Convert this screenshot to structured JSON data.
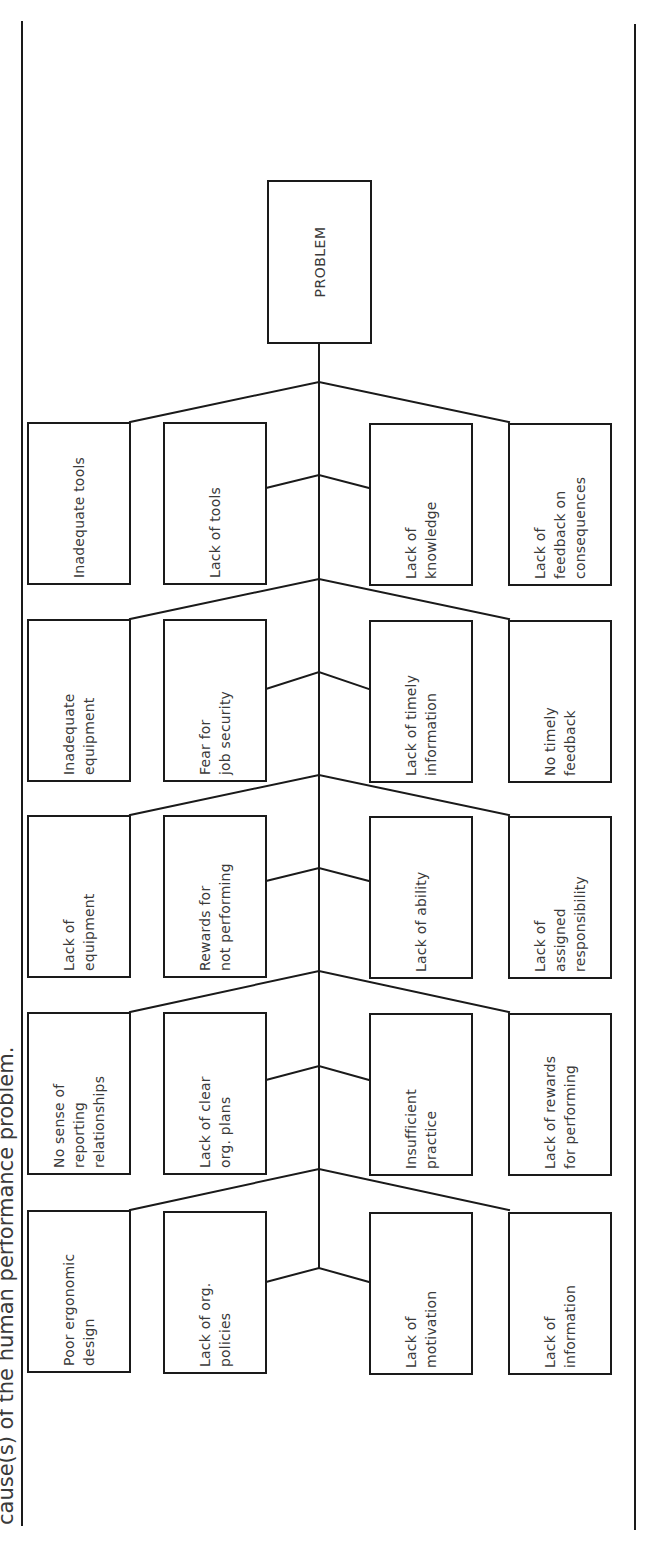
{
  "caption": "cause(s) of the human performance problem.",
  "problem": {
    "label": "PROBLEM"
  },
  "diagram": {
    "type": "fishbone",
    "orientation": "rotated-90-ccw",
    "groups": [
      {
        "outer_left": "Inadequate tools",
        "inner_left": "Lack of tools",
        "inner_right": "Lack of\nknowledge",
        "outer_right": "Lack of\nfeedback on\nconsequences"
      },
      {
        "outer_left": "Inadequate\nequipment",
        "inner_left": "Fear for\njob security",
        "inner_right": "Lack of timely\ninformation",
        "outer_right": "No timely\nfeedback"
      },
      {
        "outer_left": "Lack of\nequipment",
        "inner_left": "Rewards for\nnot performing",
        "inner_right": "Lack of ability",
        "outer_right": "Lack of\nassigned\nresponsibility"
      },
      {
        "outer_left": "No sense of\nreporting\nrelationships",
        "inner_left": "Lack of clear\norg. plans",
        "inner_right": "Insufficient\npractice",
        "outer_right": "Lack of rewards\nfor performing"
      },
      {
        "outer_left": "Poor ergonomic\ndesign",
        "inner_left": "Lack of org.\npolicies",
        "inner_right": "Lack of\nmotivation",
        "outer_right": "Lack of\ninformation"
      }
    ]
  }
}
